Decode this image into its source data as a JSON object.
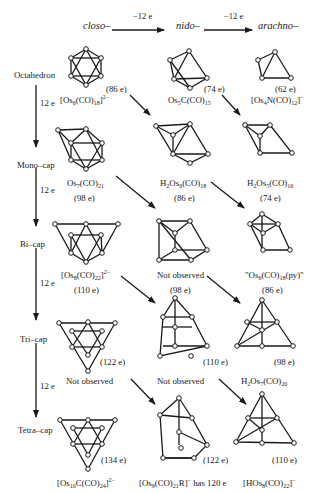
{
  "header": {
    "closo": "closo–",
    "nido": "nido–",
    "arachno": "arachno–",
    "step1": "−12 e",
    "step2": "−12 e"
  },
  "rows": [
    {
      "label": "Octahedron",
      "step": "12 e"
    },
    {
      "label": "Mono–cap",
      "step": "12 e"
    },
    {
      "label": "Bi–cap",
      "step": "12 e"
    },
    {
      "label": "Tri–cap",
      "step": "12 e"
    },
    {
      "label": "Tetra–cap",
      "step": ""
    }
  ],
  "clusters": {
    "r0c0": {
      "formula_html": "[Os<sub>6</sub>(CO)<sub>18</sub>]<sup>2−</sup>",
      "electrons": "(86 e)"
    },
    "r0c1": {
      "formula_html": "Os<sub>5</sub>C(CO)<sub>15</sub>",
      "electrons": "(74 e)"
    },
    "r0c2": {
      "formula_html": "[Os<sub>4</sub>N(CO)<sub>12</sub>]<sup>−</sup>",
      "electrons": "(62 e)"
    },
    "r1c0": {
      "formula_html": "Os<sub>7</sub>(CO)<sub>21</sub>",
      "electrons": "(98 e)"
    },
    "r1c1": {
      "formula_html": "H<sub>2</sub>Os<sub>6</sub>(CO)<sub>18</sub>",
      "electrons": "(86 e)"
    },
    "r1c2": {
      "formula_html": "H<sub>2</sub>Os<sub>5</sub>(CO)<sub>16</sub>",
      "electrons": "(74 e)"
    },
    "r2c0": {
      "formula_html": "[Os<sub>8</sub>(CO)<sub>22</sub>]<sup>2−</sup>",
      "electrons": "(110 e)"
    },
    "r2c1": {
      "formula_html": "Not observed",
      "electrons": "(98 e)"
    },
    "r2c2": {
      "formula_html": "\"Os<sub>6</sub>(CO)<sub>18</sub>(py)\"",
      "electrons": "(86 e)"
    },
    "r3c0": {
      "formula_html": "Not observed",
      "electrons": "(122 e)"
    },
    "r3c1": {
      "formula_html": "Not observed",
      "electrons": "(110 e)"
    },
    "r3c2": {
      "formula_html": "H<sub>2</sub>Os<sub>7</sub>(CO)<sub>20</sub>",
      "electrons": "(98 e)"
    },
    "r4c0": {
      "formula_html": "[Os<sub>10</sub>C(CO)<sub>24</sub>]<sup>2−</sup>",
      "electrons": "(134 e)"
    },
    "r4c1": {
      "formula_html": "[Os<sub>9</sub>(CO)<sub>21</sub>R]<sup>−</sup> has 120 e",
      "electrons": "(122 e)"
    },
    "r4c2": {
      "formula_html": "[HOs<sub>8</sub>(CO)<sub>22</sub>]<sup>−</sup>",
      "electrons": "(110 e)"
    }
  }
}
